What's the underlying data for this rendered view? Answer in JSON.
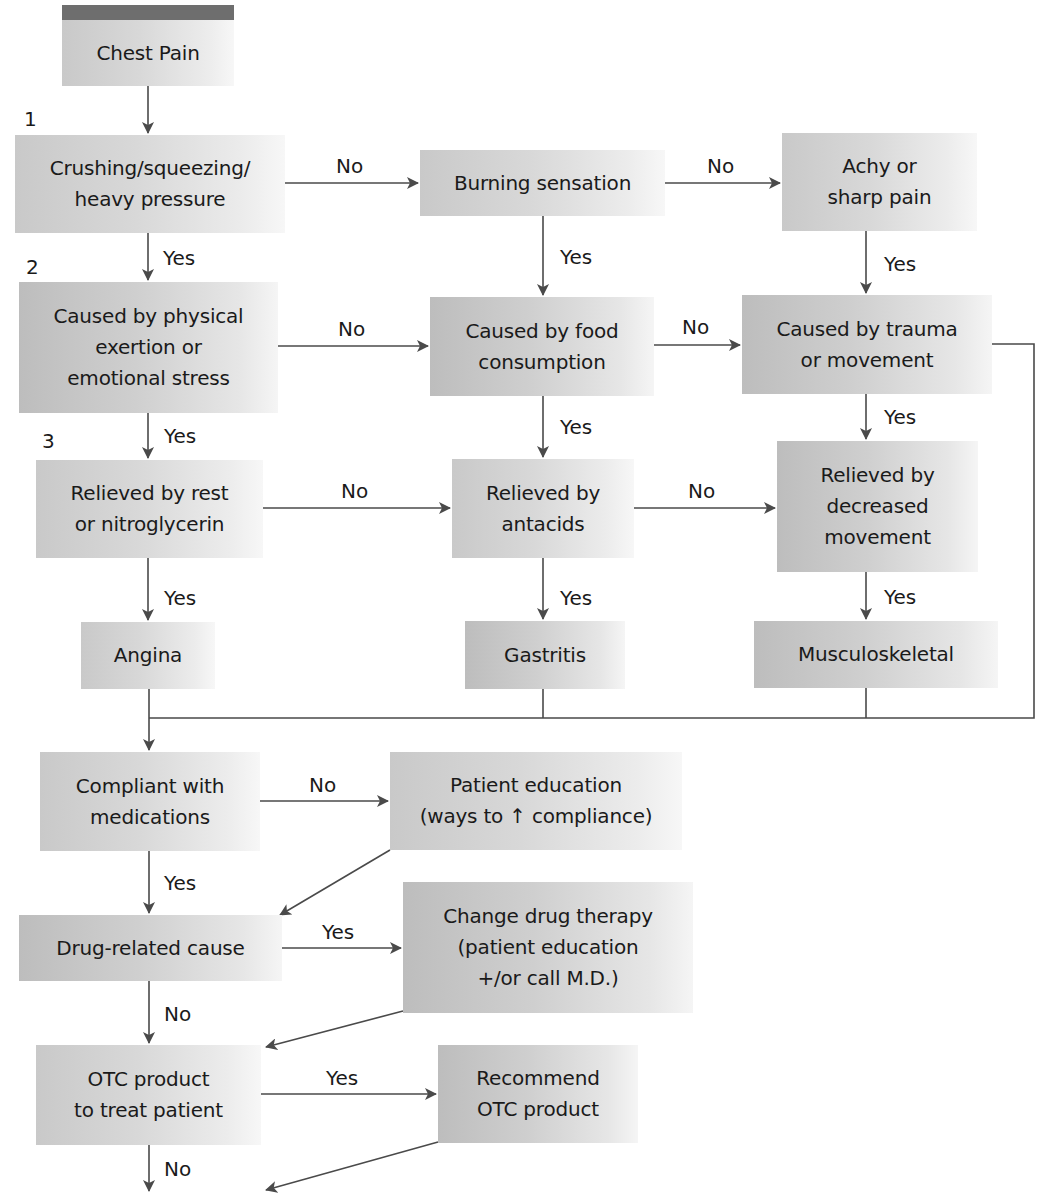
{
  "diagram": {
    "type": "flowchart",
    "title": "Chest Pain",
    "colors": {
      "box_fill": "#d4d4d4",
      "line": "#4a4a4a",
      "header_bar": "#6e6e6e",
      "text": "#1a1a1a"
    },
    "step_numbers": [
      "1",
      "2",
      "3"
    ],
    "nodes": {
      "chest_pain": "Chest Pain",
      "crushing": "Crushing/squeezing/\nheavy pressure",
      "burning": "Burning sensation",
      "achy": "Achy or\nsharp pain",
      "caused_exertion": "Caused by physical\nexertion or\nemotional stress",
      "caused_food": "Caused by food\nconsumption",
      "caused_trauma": "Caused by trauma\nor movement",
      "relieved_rest": "Relieved by rest\nor nitroglycerin",
      "relieved_antacids": "Relieved by\nantacids",
      "relieved_movement": "Relieved by\ndecreased\nmovement",
      "angina": "Angina",
      "gastritis": "Gastritis",
      "musculoskeletal": "Musculoskeletal",
      "compliant": "Compliant with\nmedications",
      "patient_education": "Patient education\n(ways to ↑ compliance)",
      "drug_related": "Drug-related cause",
      "change_therapy": "Change drug therapy\n(patient education\n+/or call M.D.)",
      "otc_product": "OTC product\nto treat patient",
      "recommend_otc": "Recommend\nOTC product"
    },
    "edge_labels": {
      "crushing_no": "No",
      "burning_no": "No",
      "crushing_yes": "Yes",
      "burning_yes": "Yes",
      "achy_yes": "Yes",
      "exertion_no": "No",
      "food_no": "No",
      "exertion_yes": "Yes",
      "food_yes": "Yes",
      "trauma_yes": "Yes",
      "rest_no": "No",
      "antacids_no": "No",
      "rest_yes": "Yes",
      "antacids_yes": "Yes",
      "movement_yes": "Yes",
      "compliant_no": "No",
      "compliant_yes": "Yes",
      "drug_yes": "Yes",
      "drug_no": "No",
      "otc_yes": "Yes",
      "otc_no": "No"
    },
    "edges": [
      [
        "Chest Pain",
        "Crushing/squeezing/heavy pressure",
        ""
      ],
      [
        "Crushing/squeezing/heavy pressure",
        "Burning sensation",
        "No"
      ],
      [
        "Burning sensation",
        "Achy or sharp pain",
        "No"
      ],
      [
        "Crushing/squeezing/heavy pressure",
        "Caused by physical exertion or emotional stress",
        "Yes"
      ],
      [
        "Burning sensation",
        "Caused by food consumption",
        "Yes"
      ],
      [
        "Achy or sharp pain",
        "Caused by trauma or movement",
        "Yes"
      ],
      [
        "Caused by physical exertion or emotional stress",
        "Caused by food consumption",
        "No"
      ],
      [
        "Caused by food consumption",
        "Caused by trauma or movement",
        "No"
      ],
      [
        "Caused by physical exertion or emotional stress",
        "Relieved by rest or nitroglycerin",
        "Yes"
      ],
      [
        "Caused by food consumption",
        "Relieved by antacids",
        "Yes"
      ],
      [
        "Caused by trauma or movement",
        "Relieved by decreased movement",
        "Yes"
      ],
      [
        "Relieved by rest or nitroglycerin",
        "Relieved by antacids",
        "No"
      ],
      [
        "Relieved by antacids",
        "Relieved by decreased movement",
        "No"
      ],
      [
        "Relieved by rest or nitroglycerin",
        "Angina",
        "Yes"
      ],
      [
        "Relieved by antacids",
        "Gastritis",
        "Yes"
      ],
      [
        "Relieved by decreased movement",
        "Musculoskeletal",
        "Yes"
      ],
      [
        "Angina",
        "Compliant with medications",
        ""
      ],
      [
        "Gastritis",
        "Compliant with medications",
        ""
      ],
      [
        "Musculoskeletal",
        "Compliant with medications",
        ""
      ],
      [
        "Caused by trauma or movement",
        "Compliant with medications",
        ""
      ],
      [
        "Compliant with medications",
        "Patient education (ways to ↑ compliance)",
        "No"
      ],
      [
        "Compliant with medications",
        "Drug-related cause",
        "Yes"
      ],
      [
        "Patient education (ways to ↑ compliance)",
        "Drug-related cause",
        ""
      ],
      [
        "Drug-related cause",
        "Change drug therapy (patient education +/or call M.D.)",
        "Yes"
      ],
      [
        "Drug-related cause",
        "OTC product to treat patient",
        "No"
      ],
      [
        "Change drug therapy (patient education +/or call M.D.)",
        "OTC product to treat patient",
        ""
      ],
      [
        "OTC product to treat patient",
        "Recommend OTC product",
        "Yes"
      ],
      [
        "OTC product to treat patient",
        "(continues below)",
        "No"
      ],
      [
        "Recommend OTC product",
        "(continues below)",
        ""
      ]
    ]
  }
}
